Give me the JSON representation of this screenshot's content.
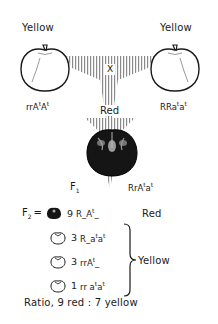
{
  "parents": {
    "left": {
      "phenotype": "Yellow",
      "genotype_parts": [
        "rrA",
        "t",
        "A",
        "t"
      ],
      "genotype": "rrAtAt",
      "color": "yellow"
    },
    "right": {
      "phenotype": "Yellow",
      "genotype_parts": [
        "RRa",
        "t",
        "a",
        "t"
      ],
      "genotype": "RRatat",
      "color": "yellow"
    }
  },
  "cross_symbol": "X",
  "f1": {
    "label": "F",
    "label_sub": "1",
    "phenotype": "Red",
    "genotype_parts": [
      "RrA",
      "t",
      "a",
      "t"
    ],
    "genotype": "RrAtat"
  },
  "f2": {
    "label": "F",
    "label_sub": "2",
    "equals": "=",
    "rows": [
      {
        "count": "9",
        "genotype_parts": [
          "R_A",
          "t",
          "_",
          ""
        ],
        "genotype": "R_At_",
        "phenotype": "Red",
        "fruit": "dark"
      },
      {
        "count": "3",
        "genotype_parts": [
          "R_a",
          "t",
          "a",
          "t"
        ],
        "genotype": "R_atat",
        "phenotype": "Yellow",
        "fruit": "light"
      },
      {
        "count": "3",
        "genotype_parts": [
          "rrA",
          "t",
          "_",
          ""
        ],
        "genotype": "rrAt_",
        "phenotype": "Yellow",
        "fruit": "light"
      },
      {
        "count": "1",
        "genotype_parts": [
          "rr a",
          "t",
          "a",
          "t"
        ],
        "genotype": "rratat",
        "phenotype": "Yellow",
        "fruit": "light"
      }
    ],
    "red_label": "Red",
    "yellow_label": "Yellow"
  },
  "ratio": "Ratio, 9 red : 7 yellow",
  "colors": {
    "ink": "#1a1a1a",
    "hatch": "#9a9a9a",
    "fruit_dark": "#151515"
  }
}
